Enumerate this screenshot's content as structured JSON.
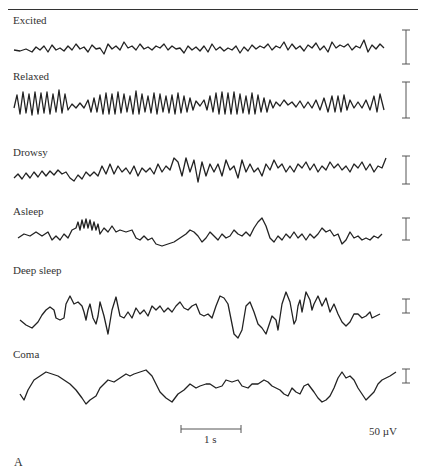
{
  "figure": {
    "panel_label": "A",
    "traces": [
      {
        "label": "Excited",
        "scale_bar_height": 34
      },
      {
        "label": "Relaxed",
        "scale_bar_height": 38
      },
      {
        "label": "Drowsy",
        "scale_bar_height": 28
      },
      {
        "label": "Asleep",
        "scale_bar_height": 20
      },
      {
        "label": "Deep sleep",
        "scale_bar_height": 14
      },
      {
        "label": "Coma",
        "scale_bar_height": 14
      }
    ],
    "time_scale": {
      "label": "1 s"
    },
    "amplitude_scale": {
      "label": "50 µV"
    }
  }
}
